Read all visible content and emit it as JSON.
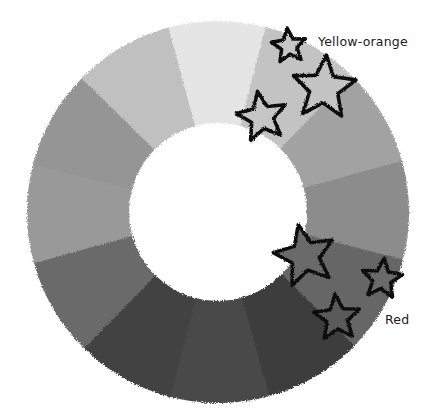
{
  "diagram": {
    "type": "color-wheel",
    "center": [
      218,
      212
    ],
    "outer_radius": 191,
    "inner_radius": 89,
    "segments": [
      {
        "name": "segment-top",
        "start_deg": 75,
        "end_deg": 105,
        "shade": "#e5e5e5"
      },
      {
        "name": "segment-yellow-orange",
        "start_deg": 45,
        "end_deg": 75,
        "shade": "#c3c3c3"
      },
      {
        "name": "segment-upper-right",
        "start_deg": 15,
        "end_deg": 45,
        "shade": "#a2a2a2"
      },
      {
        "name": "segment-right",
        "start_deg": -15,
        "end_deg": 15,
        "shade": "#8c8c8c"
      },
      {
        "name": "segment-red",
        "start_deg": -45,
        "end_deg": -15,
        "shade": "#666666"
      },
      {
        "name": "segment-lower-right",
        "start_deg": -75,
        "end_deg": -45,
        "shade": "#3c3c3c"
      },
      {
        "name": "segment-bottom",
        "start_deg": -105,
        "end_deg": -75,
        "shade": "#494949"
      },
      {
        "name": "segment-lower-left",
        "start_deg": -135,
        "end_deg": -105,
        "shade": "#434343"
      },
      {
        "name": "segment-left-lower",
        "start_deg": -165,
        "end_deg": -135,
        "shade": "#6b6b6b"
      },
      {
        "name": "segment-left",
        "start_deg": 165,
        "end_deg": 195,
        "shade": "#999999"
      },
      {
        "name": "segment-upper-left",
        "start_deg": 135,
        "end_deg": 165,
        "shade": "#959595"
      },
      {
        "name": "segment-top-left",
        "start_deg": 105,
        "end_deg": 135,
        "shade": "#c0c0c0"
      }
    ],
    "stars": [
      {
        "name": "star-yellow-orange-small",
        "cx": 289,
        "cy": 46,
        "r": 18,
        "rot": -6,
        "fill": "#c6c6c6"
      },
      {
        "name": "star-yellow-orange-large",
        "cx": 324,
        "cy": 88,
        "r": 33,
        "rot": 4,
        "fill": "#c4c4c4"
      },
      {
        "name": "star-yellow-orange-medium",
        "cx": 262,
        "cy": 117,
        "r": 26,
        "rot": -10,
        "fill": "#c6c6c6"
      },
      {
        "name": "star-red-large",
        "cx": 305,
        "cy": 256,
        "r": 32,
        "rot": -12,
        "fill": "#6a6a6a"
      },
      {
        "name": "star-red-small",
        "cx": 382,
        "cy": 279,
        "r": 21,
        "rot": 6,
        "fill": "#6a6a6a"
      },
      {
        "name": "star-red-medium",
        "cx": 337,
        "cy": 318,
        "r": 24,
        "rot": -4,
        "fill": "#5a5a5a"
      }
    ],
    "labels": [
      {
        "name": "label-yellow-orange",
        "text": "Yellow-orange",
        "x": 318,
        "y": 46
      },
      {
        "name": "label-red",
        "text": "Red",
        "x": 385,
        "y": 324
      }
    ]
  }
}
